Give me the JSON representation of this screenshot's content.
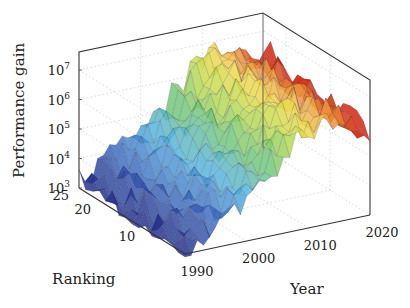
{
  "chart_data": {
    "type": "surface3d",
    "title": "",
    "zlabel": "Performance gain",
    "xlabel": "Year",
    "ylabel": "Ranking",
    "zscale": "log",
    "zlim": [
      1000,
      30000000
    ],
    "zticks": [
      {
        "value": 1000,
        "base": "10",
        "exp": "3"
      },
      {
        "value": 10000,
        "base": "10",
        "exp": "4"
      },
      {
        "value": 100000,
        "base": "10",
        "exp": "5"
      },
      {
        "value": 1000000,
        "base": "10",
        "exp": "6"
      },
      {
        "value": 10000000,
        "base": "10",
        "exp": "7"
      }
    ],
    "xticks": [
      "1990",
      "2000",
      "2010",
      "2020"
    ],
    "xlim": [
      1990,
      2020
    ],
    "yticks": [
      "10",
      "20",
      "25"
    ],
    "ylim": [
      1,
      25
    ],
    "colormap": "jet-like (blue → cyan → green → yellow → orange → red) by year/height",
    "grid": true,
    "trend_by_year": {
      "years": [
        1990,
        1995,
        2000,
        2005,
        2010,
        2015,
        2020
      ],
      "approx_gain_log10": [
        3.0,
        3.6,
        4.3,
        5.3,
        6.3,
        6.5,
        6.3
      ]
    }
  },
  "labels": {
    "zlabel": "Performance gain",
    "xlabel": "Year",
    "ylabel": "Ranking"
  }
}
